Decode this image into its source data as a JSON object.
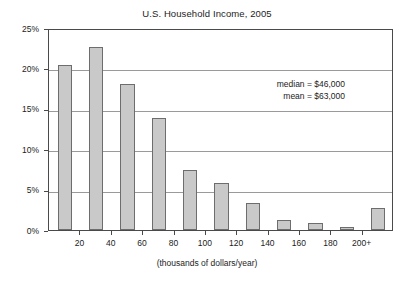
{
  "chart_data": {
    "type": "bar",
    "title": "U.S. Household Income, 2005",
    "xlabel": "(thousands of dollars/year)",
    "ylabel": "",
    "categories": [
      "0-20",
      "20-40",
      "40-60",
      "60-80",
      "80-100",
      "100-120",
      "120-140",
      "140-160",
      "160-180",
      "180-200",
      "200+"
    ],
    "values": [
      20.4,
      22.6,
      18.1,
      13.9,
      7.4,
      5.8,
      3.4,
      1.3,
      0.9,
      0.4,
      2.7
    ],
    "xlim": [
      0,
      220
    ],
    "ylim": [
      0,
      25
    ],
    "ytick_values": [
      0,
      5,
      10,
      15,
      20,
      25
    ],
    "ytick_labels": [
      "0%",
      "5%",
      "10%",
      "15%",
      "20%",
      "25%"
    ],
    "xtick_values": [
      20,
      40,
      60,
      80,
      100,
      120,
      140,
      160,
      180,
      200
    ],
    "xtick_labels": [
      "20",
      "40",
      "60",
      "80",
      "100",
      "120",
      "140",
      "160",
      "180",
      "200+"
    ],
    "grid": "horizontal",
    "legend": "none",
    "bar_fill_color": "#c9c9c9",
    "bar_edge_color": "#6d6d6d",
    "gridline_color": "#9a9a9a",
    "axis_color": "#4a4a4a",
    "background_color": "#ffffff",
    "annotations": [
      {
        "label": "median = $46,000"
      },
      {
        "label": "mean = $63,000"
      }
    ]
  }
}
